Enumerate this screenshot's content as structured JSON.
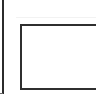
{
  "canvas": {
    "width": 96,
    "height": 101,
    "background": "#ffffff"
  },
  "shapes": [
    {
      "kind": "vertical-line",
      "x": 2,
      "y1": 0,
      "y2": 94,
      "color": "#2b2b2b"
    },
    {
      "kind": "rectangle",
      "x": 20,
      "y": 24,
      "width": 90,
      "height": 66,
      "stroke": "#2f2f2f",
      "clipped_right": true
    }
  ],
  "labels": []
}
